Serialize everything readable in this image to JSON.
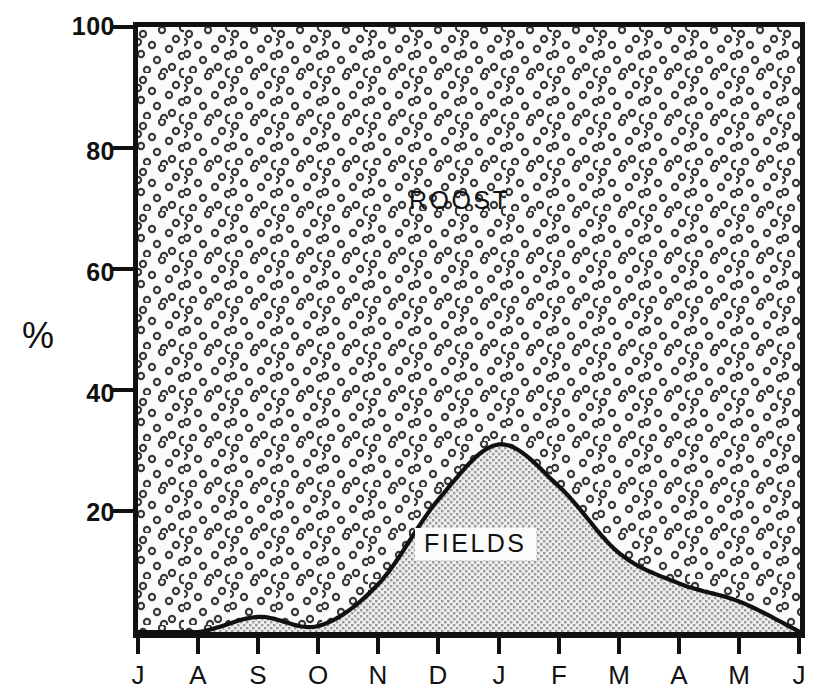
{
  "axes": {
    "y_label": "%",
    "y_ticks": [
      100,
      80,
      60,
      40,
      20
    ],
    "y_range": [
      0,
      100
    ],
    "x_ticks": [
      "J",
      "A",
      "S",
      "O",
      "N",
      "D",
      "J",
      "F",
      "M",
      "A",
      "M",
      "J"
    ]
  },
  "labels": {
    "roost": "ROOST",
    "fields": "FIELDS"
  },
  "colors": {
    "axis": "#111111",
    "roost_fill": "#fbfbfb",
    "roost_dot": "#3b3b3b",
    "fields_fill": "#e2e2e2",
    "fields_dot": "#9a9a9a",
    "curve": "#111111"
  },
  "chart_data": {
    "type": "area",
    "title": "",
    "xlabel": "",
    "ylabel": "%",
    "ylim": [
      0,
      100
    ],
    "xlim": [
      0,
      11
    ],
    "grid": false,
    "legend_position": "inline-annotations",
    "stacked": true,
    "categories": [
      "J",
      "A",
      "S",
      "O",
      "N",
      "D",
      "J",
      "F",
      "M",
      "A",
      "M",
      "J"
    ],
    "series": [
      {
        "name": "FIELDS",
        "values": [
          0,
          0,
          2.5,
          1.0,
          8,
          22,
          31,
          24,
          13,
          8,
          5,
          0
        ],
        "fill": "fine-dot-texture"
      },
      {
        "name": "ROOST",
        "values": [
          100,
          100,
          97.5,
          99.0,
          92,
          78,
          69,
          76,
          87,
          92,
          95,
          100
        ],
        "fill": "open-circle-texture"
      }
    ],
    "annotations": [
      {
        "text": "ROOST",
        "x": "D",
        "y": 69
      },
      {
        "text": "FIELDS",
        "x": "J",
        "y": 17
      }
    ]
  }
}
